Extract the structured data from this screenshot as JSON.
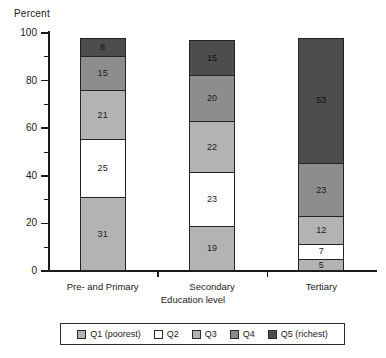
{
  "chart_data": {
    "type": "bar",
    "subtype": "stacked-percentage",
    "title": "",
    "xlabel": "Education level",
    "ylabel": "Percent",
    "categories": [
      "Pre- and Primary",
      "Secondary",
      "Tertiary"
    ],
    "series": [
      {
        "name": "Q1 (poorest)",
        "color": "#b3b3b3",
        "values": [
          31,
          19,
          5
        ]
      },
      {
        "name": "Q2",
        "color": "#ffffff",
        "values": [
          25,
          23,
          7
        ]
      },
      {
        "name": "Q3",
        "color": "#b3b3b3",
        "values": [
          21,
          22,
          12
        ]
      },
      {
        "name": "Q4",
        "color": "#8d8d8d",
        "values": [
          15,
          20,
          23
        ]
      },
      {
        "name": "Q5 (richest)",
        "color": "#4d4d4d",
        "values": [
          8,
          15,
          53
        ]
      }
    ],
    "ylim": [
      0,
      100
    ],
    "yticks": [
      0,
      20,
      40,
      60,
      80,
      100
    ],
    "ytick_labels": [
      "0",
      "20",
      "40",
      "60",
      "80",
      "100"
    ],
    "yminor_ticks": [
      10,
      30,
      50,
      70,
      90
    ],
    "grid": false,
    "legend_position": "bottom",
    "legend_entries": [
      "Q1 (poorest)",
      "Q2",
      "Q3",
      "Q4",
      "Q5 (richest)"
    ]
  }
}
